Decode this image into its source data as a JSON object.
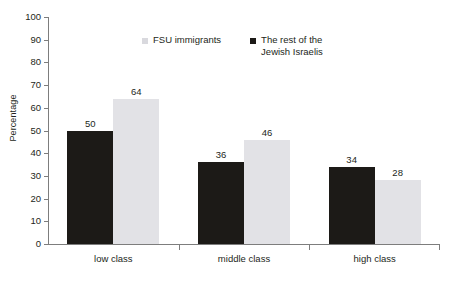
{
  "chart_data": {
    "type": "bar",
    "title": "",
    "subtitle": "",
    "xlabel": "",
    "ylabel": "Percentage",
    "ylim": [
      0,
      100
    ],
    "ytick_step": 10,
    "ytick_labels": [
      "100",
      "90",
      "80",
      "70",
      "60",
      "50",
      "40",
      "30",
      "20",
      "10",
      "0"
    ],
    "grid": false,
    "legend_position": "top-center",
    "categories": [
      "low class",
      "middle class",
      "high class"
    ],
    "series": [
      {
        "name": "The rest of the Jewish Israelis",
        "color": "#1c1a17",
        "values": [
          50,
          36,
          34
        ],
        "value_labels": [
          "50",
          "36",
          "34"
        ]
      },
      {
        "name": "FSU immigrants",
        "color": "#e2e2e6",
        "values": [
          64,
          46,
          28
        ],
        "value_labels": [
          "64",
          "46",
          "28"
        ]
      }
    ],
    "legend": [
      {
        "label": "FSU immigrants",
        "color": "#d9d9de",
        "swatch": "light-square-icon"
      },
      {
        "label": "The rest of the\nJewish Israelis",
        "color": "#1c1a17",
        "swatch": "dark-square-icon"
      }
    ]
  },
  "axis": {
    "color": "#7d7d7d"
  }
}
